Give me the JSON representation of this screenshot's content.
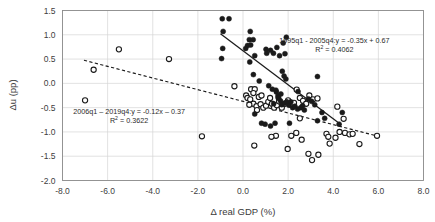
{
  "chart_data": {
    "type": "scatter",
    "title": "",
    "xlabel": "Δ real GDP (%)",
    "ylabel": "Δu (pp)",
    "xlim": [
      -8.0,
      8.0
    ],
    "ylim": [
      -2.0,
      1.5
    ],
    "xticks": [
      "-8.0",
      "-6.0",
      "-4.0",
      "-2.0",
      "0.0",
      "2.0",
      "4.0",
      "6.0",
      "8.0"
    ],
    "yticks": [
      "1.5",
      "1.0",
      "0.5",
      "0.0",
      "-0.5",
      "-1.0",
      "-1.5",
      "-2.0"
    ],
    "grid": true,
    "legend_position": "none",
    "series": [
      {
        "name": "1995q1 - 2005q4",
        "marker": "filled-circle",
        "color": "#1a1a1a",
        "points": [
          [
            -0.92,
            1.33
          ],
          [
            -0.62,
            1.33
          ],
          [
            -0.88,
            1.07
          ],
          [
            -0.9,
            0.72
          ],
          [
            -0.95,
            0.51
          ],
          [
            0.32,
            1.07
          ],
          [
            0.28,
            0.9
          ],
          [
            0.45,
            0.9
          ],
          [
            0.2,
            0.78
          ],
          [
            0.34,
            0.79
          ],
          [
            0.12,
            0.72
          ],
          [
            0.3,
            0.44
          ],
          [
            0.52,
            0.57
          ],
          [
            0.46,
            0.18
          ],
          [
            1.02,
            0.7
          ],
          [
            1.22,
            0.68
          ],
          [
            1.35,
            0.62
          ],
          [
            1.5,
            0.74
          ],
          [
            1.62,
            0.57
          ],
          [
            1.78,
            0.83
          ],
          [
            1.92,
            0.95
          ],
          [
            1.86,
            0.61
          ],
          [
            1.74,
            0.25
          ],
          [
            1.82,
            0.15
          ],
          [
            1.9,
            0.09
          ],
          [
            1.05,
            0.62
          ],
          [
            0.72,
            0.05
          ],
          [
            1.14,
            -0.05
          ],
          [
            1.3,
            -0.12
          ],
          [
            1.48,
            -0.18
          ],
          [
            1.58,
            -0.3
          ],
          [
            1.66,
            -0.36
          ],
          [
            1.72,
            -0.44
          ],
          [
            1.84,
            -0.41
          ],
          [
            1.94,
            -0.38
          ],
          [
            2.04,
            -0.45
          ],
          [
            2.12,
            -0.38
          ],
          [
            2.2,
            -0.5
          ],
          [
            2.3,
            -0.47
          ],
          [
            2.42,
            -0.53
          ],
          [
            2.56,
            -0.5
          ],
          [
            2.64,
            -0.46
          ],
          [
            2.72,
            -0.55
          ],
          [
            1.46,
            -0.14
          ],
          [
            1.55,
            -0.26
          ],
          [
            1.68,
            -0.22
          ],
          [
            3.3,
            0.14
          ],
          [
            2.44,
            -0.17
          ],
          [
            2.9,
            -0.32
          ],
          [
            3.04,
            -0.37
          ],
          [
            3.18,
            -0.44
          ],
          [
            3.3,
            -0.77
          ],
          [
            3.5,
            -0.6
          ],
          [
            3.62,
            -0.72
          ],
          [
            4.26,
            -0.84
          ],
          [
            4.4,
            -0.6
          ],
          [
            0.52,
            -0.63
          ],
          [
            0.82,
            -0.82
          ],
          [
            0.98,
            -0.84
          ],
          [
            1.22,
            -0.88
          ],
          [
            1.42,
            -0.82
          ],
          [
            2.06,
            -0.82
          ],
          [
            1.56,
            -0.3
          ],
          [
            1.36,
            -0.42
          ]
        ]
      },
      {
        "name": "2006q1 – 2019q4",
        "marker": "open-circle",
        "color": "#1a1a1a",
        "points": [
          [
            -7.0,
            -0.35
          ],
          [
            -6.62,
            0.28
          ],
          [
            -5.5,
            0.7
          ],
          [
            -3.28,
            0.5
          ],
          [
            -1.82,
            -1.09
          ],
          [
            -0.38,
            -0.06
          ],
          [
            0.36,
            -0.12
          ],
          [
            0.52,
            -0.12
          ],
          [
            0.14,
            -0.25
          ],
          [
            0.2,
            -0.3
          ],
          [
            0.32,
            -0.33
          ],
          [
            0.46,
            -0.42
          ],
          [
            0.6,
            -0.47
          ],
          [
            0.78,
            -0.43
          ],
          [
            0.9,
            -0.5
          ],
          [
            1.02,
            -0.46
          ],
          [
            1.12,
            -0.38
          ],
          [
            1.2,
            -0.3
          ],
          [
            1.28,
            -0.42
          ],
          [
            0.7,
            -0.28
          ],
          [
            0.82,
            -0.25
          ],
          [
            0.46,
            -0.2
          ],
          [
            0.28,
            -0.44
          ],
          [
            0.62,
            -0.55
          ],
          [
            1.38,
            -0.5
          ],
          [
            1.5,
            -0.45
          ],
          [
            1.6,
            -0.37
          ],
          [
            1.72,
            -0.5
          ],
          [
            1.86,
            -0.42
          ],
          [
            2.0,
            -0.35
          ],
          [
            2.12,
            -0.44
          ],
          [
            2.26,
            -0.4
          ],
          [
            2.38,
            -0.13
          ],
          [
            2.52,
            -0.3
          ],
          [
            2.66,
            -0.36
          ],
          [
            2.8,
            -0.42
          ],
          [
            2.94,
            -0.25
          ],
          [
            3.1,
            -0.33
          ],
          [
            3.3,
            -0.31
          ],
          [
            4.18,
            -0.48
          ],
          [
            4.46,
            -0.73
          ],
          [
            0.5,
            -1.28
          ],
          [
            1.46,
            -1.08
          ],
          [
            1.98,
            -1.35
          ],
          [
            2.36,
            -1.02
          ],
          [
            2.6,
            -1.16
          ],
          [
            2.9,
            -1.45
          ],
          [
            3.06,
            -1.58
          ],
          [
            3.34,
            -1.47
          ],
          [
            3.7,
            -1.04
          ],
          [
            3.78,
            -1.1
          ],
          [
            3.84,
            -1.24
          ],
          [
            4.1,
            -1.12
          ],
          [
            4.28,
            -1.0
          ],
          [
            4.52,
            -1.02
          ],
          [
            4.72,
            -1.05
          ],
          [
            4.86,
            -1.04
          ],
          [
            5.16,
            -1.25
          ],
          [
            5.94,
            -1.08
          ],
          [
            2.52,
            -0.72
          ],
          [
            1.26,
            -1.1
          ],
          [
            2.14,
            -1.08
          ]
        ]
      }
    ],
    "trendlines": [
      {
        "name": "1995q1 - 2005q4 trend",
        "style": "solid",
        "slope": -0.35,
        "intercept": 0.67,
        "x_start": -1.0,
        "x_end": 4.35
      },
      {
        "name": "2006q1 – 2019q4 trend",
        "style": "dashed",
        "slope": -0.12,
        "intercept": -0.37,
        "x_start": -7.05,
        "x_end": 6.0
      }
    ],
    "annotations": [
      {
        "id": "annotation-period-1",
        "line1": "1995q1 - 2005q4:y = -0.35x + 0.67",
        "r2_prefix": "R",
        "r2_sup": "2",
        "r2_value": "= 0.4062",
        "x": 4.05,
        "y": 0.84
      },
      {
        "id": "annotation-period-2",
        "line1": "2006q1 – 2019q4:y = -0.12x – 0.37",
        "r2_prefix": "R",
        "r2_sup": "2",
        "r2_value": "= 0.3622",
        "x": -5.05,
        "y": -0.63
      }
    ]
  }
}
